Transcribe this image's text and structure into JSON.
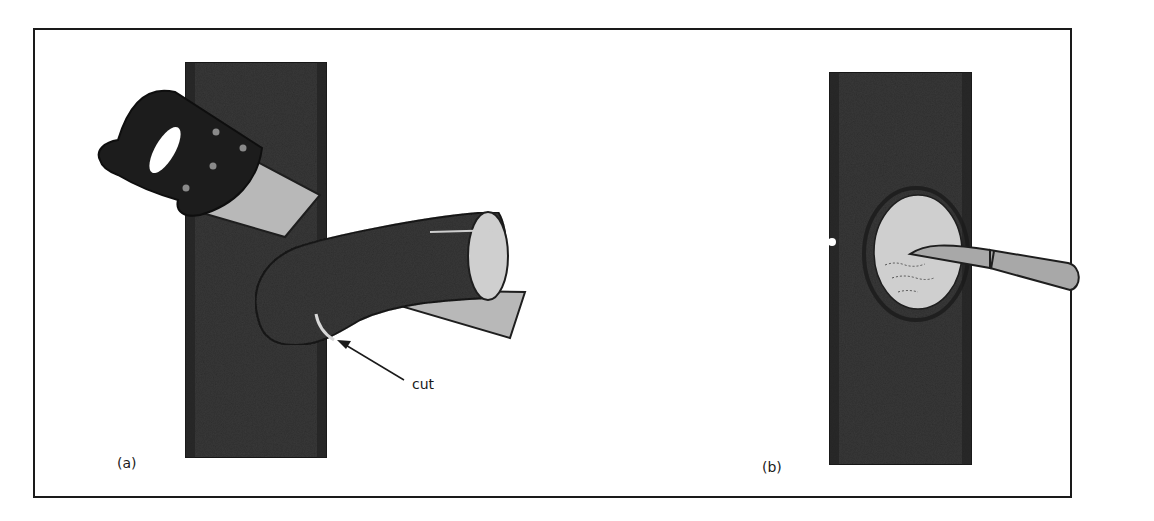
{
  "figure": {
    "panels": [
      {
        "id": "a",
        "label": "(a)",
        "description": "Hand saw cutting a side branch from a tree trunk",
        "callout": {
          "text": "cut",
          "points_to": "cut line on branch collar"
        }
      },
      {
        "id": "b",
        "label": "(b)",
        "description": "Knife trimming the edges of the wound where the branch was removed"
      }
    ],
    "colors": {
      "bark": "#3a3a3a",
      "bark_dark": "#1e1e1e",
      "wood": "#cfcfcf",
      "saw_handle": "#1c1c1c",
      "saw_blade": "#b8b8b8",
      "knife": "#a8a8a8",
      "frame": "#1a1a1a"
    }
  }
}
